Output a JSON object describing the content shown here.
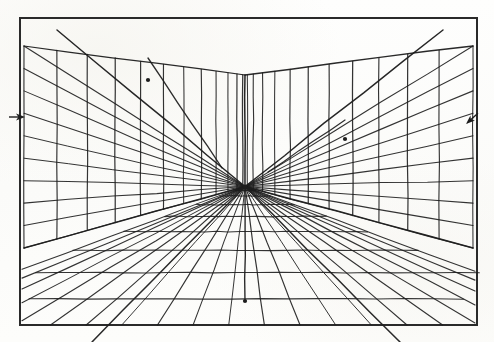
{
  "figure": {
    "kind": "hand-drawn perspective grid diagram",
    "title": "Two-point perspective interior grid",
    "media": "pencil on off-white paper",
    "paper_color": "#fbfbf9",
    "ink_color": "#1d1d1d",
    "border_color": "#2a2a2a"
  },
  "canvas": {
    "width": 494,
    "height": 342
  },
  "frame": {
    "label": "drawing border",
    "x": 20,
    "y": 18,
    "width": 457,
    "height": 307,
    "stroke_width": 2
  },
  "geometry": {
    "vanishing_point": {
      "x": 245,
      "y": 186.5
    },
    "corner_top": {
      "x": 245,
      "y": 75
    },
    "corner_bottom": {
      "x": 245,
      "y": 186.5
    },
    "floor_drop_line": {
      "x": 245,
      "y_top": 186.5,
      "y_bottom": 301
    },
    "left_wall": {
      "top_outer": {
        "x": 24,
        "y": 46
      },
      "bottom_outer": {
        "x": 24,
        "y": 248
      },
      "top_inner": {
        "x": 245,
        "y": 75
      },
      "bottom_inner": {
        "x": 245,
        "y": 186.5
      },
      "vertical_count": 12,
      "horizontal_count": 9,
      "diagonal_start": {
        "x": 57,
        "y": 30
      },
      "diagonal_end": {
        "x": 245,
        "y": 186.5
      }
    },
    "right_wall": {
      "top_outer": {
        "x": 473,
        "y": 46
      },
      "bottom_outer": {
        "x": 473,
        "y": 248
      },
      "top_inner": {
        "x": 245,
        "y": 75
      },
      "bottom_inner": {
        "x": 245,
        "y": 186.5
      },
      "vertical_count": 12,
      "horizontal_count": 9,
      "diagonal_start": {
        "x": 443,
        "y": 30
      },
      "diagonal_end": {
        "x": 245,
        "y": 186.5
      }
    },
    "floor": {
      "radial_line_count": 21,
      "transverse_line_count": 11,
      "near_edge_y": 325
    }
  },
  "markers": [
    {
      "name": "left-horizon-arrow",
      "type": "arrowhead",
      "direction": "left",
      "x": 25,
      "y": 117,
      "note": "arrow on horizon line at left frame edge"
    },
    {
      "name": "right-horizon-arrow",
      "type": "arrowhead",
      "direction": "up-right",
      "x": 466,
      "y": 124,
      "note": "arrow near right frame edge above horizon"
    },
    {
      "name": "vanishing-point-dot",
      "type": "dot",
      "x": 245,
      "y": 186.5,
      "note": "central vanishing point node"
    },
    {
      "name": "floor-axis-dot",
      "type": "dot",
      "x": 245,
      "y": 301,
      "note": "node at bottom of central floor drop line"
    },
    {
      "name": "left-wall-diagonal-node",
      "type": "dot",
      "x": 148,
      "y": 80,
      "note": "node where upper left diagonal crosses a vertical"
    },
    {
      "name": "right-wall-diagonal-node",
      "type": "dot",
      "x": 345,
      "y": 139,
      "note": "node where right diagonal crosses a vertical"
    }
  ],
  "chart_data": {
    "type": "line",
    "title": "Two-point perspective interior grid",
    "xlabel": "",
    "ylabel": "",
    "series": [
      {
        "name": "frame",
        "values": [
          20,
          18,
          477,
          325
        ]
      },
      {
        "name": "left-wall-verticals",
        "values": [
          12
        ]
      },
      {
        "name": "left-wall-horizontals",
        "values": [
          9
        ]
      },
      {
        "name": "right-wall-verticals",
        "values": [
          12
        ]
      },
      {
        "name": "right-wall-horizontals",
        "values": [
          9
        ]
      },
      {
        "name": "floor-radials",
        "values": [
          21
        ]
      },
      {
        "name": "floor-transverse",
        "values": [
          11
        ]
      },
      {
        "name": "diagonals",
        "values": [
          4
        ]
      }
    ]
  }
}
